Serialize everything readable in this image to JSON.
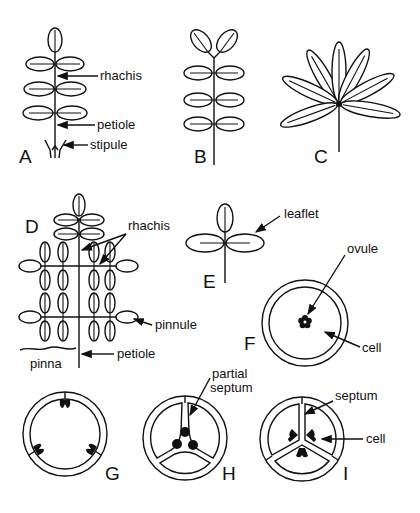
{
  "figure": {
    "background": "#ffffff",
    "ink": "#111111",
    "panels": {
      "A": {
        "letter": "A",
        "labels": {
          "rhachis": "rhachis",
          "petiole": "petiole",
          "stipule": "stipule"
        }
      },
      "B": {
        "letter": "B"
      },
      "C": {
        "letter": "C"
      },
      "D": {
        "letter": "D",
        "labels": {
          "rhachis": "rhachis",
          "pinnule": "pinnule",
          "pinna": "pinna",
          "petiole": "petiole"
        }
      },
      "E": {
        "letter": "E",
        "labels": {
          "leaflet": "leaflet"
        }
      },
      "F": {
        "letter": "F",
        "labels": {
          "ovule": "ovule",
          "cell": "cell"
        }
      },
      "G": {
        "letter": "G"
      },
      "H": {
        "letter": "H",
        "labels": {
          "partial_line1": "partial",
          "partial_line2": "septum"
        }
      },
      "I": {
        "letter": "I",
        "labels": {
          "septum": "septum",
          "cell": "cell"
        }
      }
    }
  }
}
